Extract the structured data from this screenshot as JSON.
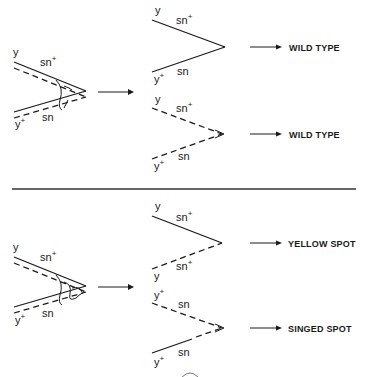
{
  "panels": [
    {
      "id": "top",
      "crossover": {
        "chromatid_1": {
          "left_label": "y",
          "right_label": "sn",
          "right_sup": "+"
        },
        "chromatid_2": {
          "left_label": "y",
          "left_sup": "+",
          "right_label": "sn"
        }
      },
      "products": [
        {
          "upper": {
            "left_label": "y",
            "right_label": "sn",
            "right_sup": "+",
            "style": "solid"
          },
          "lower": {
            "left_label": "y",
            "left_sup": "+",
            "right_label": "sn",
            "style": "solid"
          },
          "result": "WILD TYPE"
        },
        {
          "upper": {
            "left_label": "y",
            "right_label": "sn",
            "right_sup": "+",
            "style": "dashed"
          },
          "lower": {
            "left_label": "y",
            "left_sup": "+",
            "right_label": "sn",
            "style": "dashed"
          },
          "result": "WILD TYPE"
        }
      ]
    },
    {
      "id": "bottom",
      "crossover": {
        "chromatid_1": {
          "left_label": "y",
          "right_label": "sn",
          "right_sup": "+"
        },
        "chromatid_2": {
          "left_label": "y",
          "left_sup": "+",
          "right_label": "sn"
        }
      },
      "products": [
        {
          "upper": {
            "left_label": "y",
            "right_label": "sn",
            "right_sup": "+",
            "style": "solid"
          },
          "lower": {
            "left_label": "y",
            "right_label": "sn",
            "right_sup": "+",
            "style": "dashed"
          },
          "result": "YELLOW SPOT"
        },
        {
          "upper": {
            "left_label": "y",
            "left_sup": "+",
            "right_label": "sn",
            "style": "dashed"
          },
          "lower": {
            "left_label": "y",
            "left_sup": "+",
            "right_label": "sn",
            "style": "solid-then-dashed"
          },
          "result": "SINGED SPOT"
        }
      ]
    }
  ]
}
